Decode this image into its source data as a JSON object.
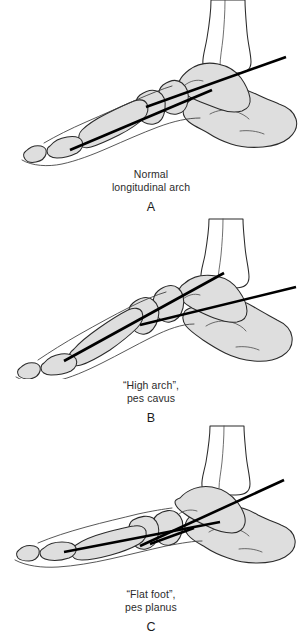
{
  "figure": {
    "background_color": "#ffffff",
    "bone_fill_color": "#dedede",
    "bone_outline_color": "#2a2a2a",
    "axis_line_color": "#000000",
    "panels": [
      {
        "letter": "A",
        "caption_line_1": "Normal",
        "caption_line_2": "longitudinal arch",
        "condition": "Normal longitudinal arch",
        "axis_relationship": "talus and first metatarsal axes nearly collinear",
        "bones": [
          "tibia",
          "fibula",
          "talus",
          "calcaneus",
          "navicular",
          "cuneiform",
          "first metatarsal",
          "proximal phalanx",
          "distal phalanx"
        ]
      },
      {
        "letter": "B",
        "caption_line_1": "“High arch”,",
        "caption_line_2": "pes cavus",
        "condition": "High arch, pes cavus",
        "axis_relationship": "metatarsal axis angled steeply upward relative to talus axis",
        "bones": [
          "tibia",
          "fibula",
          "talus",
          "calcaneus",
          "navicular",
          "cuneiform",
          "first metatarsal",
          "proximal phalanx",
          "distal phalanx"
        ]
      },
      {
        "letter": "C",
        "caption_line_1": "“Flat foot”,",
        "caption_line_2": "pes planus",
        "condition": "Flat foot, pes planus",
        "axis_relationship": "talus axis angled steeply downward relative to flattened metatarsal axis",
        "bones": [
          "tibia",
          "fibula",
          "talus",
          "calcaneus",
          "navicular",
          "cuneiform",
          "first metatarsal",
          "proximal phalanx",
          "distal phalanx"
        ]
      }
    ]
  }
}
